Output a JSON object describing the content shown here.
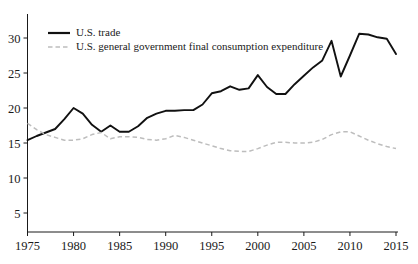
{
  "chart_data": {
    "type": "line",
    "title": "",
    "subtitle": "",
    "xlabel": "",
    "ylabel": "",
    "xlim": [
      1975,
      2015
    ],
    "ylim": [
      0,
      33
    ],
    "grid": false,
    "legend_position": "top-left",
    "x_tick_labels": [
      "1975",
      "1980",
      "1985",
      "1990",
      "1995",
      "2000",
      "2005",
      "2010",
      "2015"
    ],
    "x_ticks": [
      1975,
      1980,
      1985,
      1990,
      1995,
      2000,
      2005,
      2010,
      2015
    ],
    "y_tick_labels": [
      "5",
      "10",
      "15",
      "20",
      "25",
      "30"
    ],
    "y_ticks": [
      5,
      10,
      15,
      20,
      25,
      30
    ],
    "x": [
      1975,
      1976,
      1977,
      1978,
      1979,
      1980,
      1981,
      1982,
      1983,
      1984,
      1985,
      1986,
      1987,
      1988,
      1989,
      1990,
      1991,
      1992,
      1993,
      1994,
      1995,
      1996,
      1997,
      1998,
      1999,
      2000,
      2001,
      2002,
      2003,
      2004,
      2005,
      2006,
      2007,
      2008,
      2009,
      2010,
      2011,
      2012,
      2013,
      2014,
      2015
    ],
    "series": [
      {
        "name": "U.S. trade",
        "style": "solid",
        "color": "#111111",
        "values": [
          15.4,
          16.0,
          16.5,
          17.0,
          18.4,
          20.0,
          19.2,
          17.6,
          16.6,
          17.5,
          16.6,
          16.6,
          17.4,
          18.6,
          19.2,
          19.6,
          19.6,
          19.7,
          19.7,
          20.5,
          22.1,
          22.4,
          23.1,
          22.6,
          22.8,
          24.7,
          23.0,
          22.0,
          22.0,
          23.4,
          24.6,
          25.8,
          26.8,
          29.6,
          24.5,
          27.5,
          30.6,
          30.5,
          30.1,
          29.9,
          27.7
        ]
      },
      {
        "name": "U.S. general government final consumption expenditure",
        "style": "dashed",
        "color": "#bdbdbd",
        "values": [
          17.8,
          16.9,
          16.2,
          15.8,
          15.4,
          15.4,
          15.6,
          16.2,
          16.5,
          15.6,
          15.9,
          15.9,
          15.8,
          15.5,
          15.4,
          15.6,
          16.1,
          15.8,
          15.4,
          15.0,
          14.6,
          14.2,
          13.9,
          13.8,
          13.8,
          14.2,
          14.7,
          15.1,
          15.1,
          15.0,
          15.0,
          15.1,
          15.5,
          16.2,
          16.6,
          16.6,
          16.0,
          15.4,
          14.9,
          14.5,
          14.2
        ]
      }
    ]
  }
}
